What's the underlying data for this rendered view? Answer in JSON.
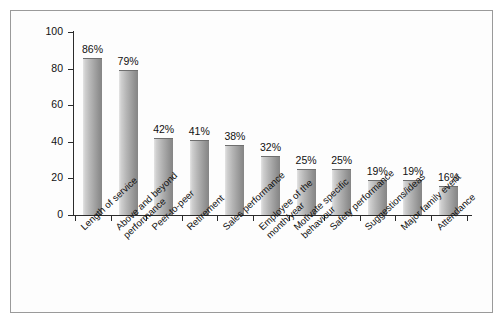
{
  "chart_data": {
    "type": "bar",
    "title": "",
    "subtitle": "",
    "xlabel": "",
    "ylabel": "",
    "ylim": [
      0,
      100
    ],
    "yticks": [
      0,
      20,
      40,
      60,
      80,
      100
    ],
    "grid": false,
    "legend": null,
    "orientation": "vertical",
    "value_suffix": "%",
    "categories": [
      "Length of service",
      "Above and beyond performance",
      "Peer-to-peer",
      "Retirement",
      "Sales performance",
      "Employee of the month/year",
      "Motivate specific behaviour",
      "Safety performance",
      "Suggestions/ideas",
      "Major family event",
      "Attendance"
    ],
    "category_lines": [
      [
        "Length of service"
      ],
      [
        "Above and beyond",
        "performance"
      ],
      [
        "Peer-to-peer"
      ],
      [
        "Retirement"
      ],
      [
        "Sales performance"
      ],
      [
        "Employee of the",
        "month/year"
      ],
      [
        "Motivate specific",
        "behaviour"
      ],
      [
        "Safety performance"
      ],
      [
        "Suggestions/ideas"
      ],
      [
        "Major family event"
      ],
      [
        "Attendance"
      ]
    ],
    "values": [
      86,
      79,
      42,
      41,
      38,
      32,
      25,
      25,
      19,
      19,
      16
    ],
    "value_labels": [
      "86%",
      "79%",
      "42%",
      "41%",
      "38%",
      "32%",
      "25%",
      "25%",
      "19%",
      "19%",
      "16%"
    ],
    "tick_labels": [
      "0",
      "20",
      "40",
      "60",
      "80",
      "100"
    ],
    "colors": {
      "bar_light": "#e4e4e4",
      "bar_dark": "#858585",
      "axis": "#2b2b2b",
      "text": "#111111",
      "frame": "#9a9a9a",
      "background": "#fdfdfd"
    }
  }
}
